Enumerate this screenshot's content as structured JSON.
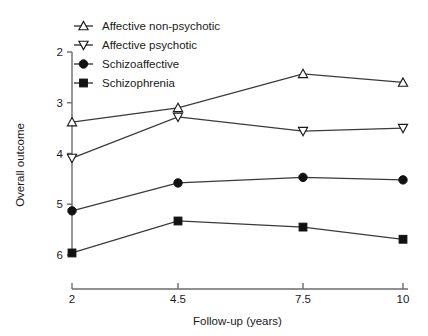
{
  "chart_data": {
    "type": "line",
    "title": "",
    "xlabel": "Follow-up (years)",
    "ylabel": "Overall outcome",
    "x": [
      2,
      4.5,
      7.5,
      10
    ],
    "x_tick_labels": [
      "2",
      "4.5",
      "7.5",
      "10"
    ],
    "y_tick_labels": [
      "2",
      "3",
      "4",
      "5",
      "6"
    ],
    "y_ticks": [
      2,
      3,
      4,
      5,
      6
    ],
    "ylim": [
      2,
      6
    ],
    "y_axis_inverted": true,
    "grid": false,
    "legend_position": "top-left",
    "series": [
      {
        "name": "Affective non-psychotic",
        "marker": "triangle-up-open",
        "values": [
          3.38,
          3.1,
          2.43,
          2.6
        ]
      },
      {
        "name": "Affective psychotic",
        "marker": "triangle-down-open",
        "values": [
          4.09,
          3.28,
          3.56,
          3.5
        ]
      },
      {
        "name": "Schizoaffective",
        "marker": "circle-filled",
        "values": [
          5.13,
          4.58,
          4.47,
          4.52
        ]
      },
      {
        "name": "Schizophrenia",
        "marker": "square-filled",
        "values": [
          5.96,
          5.33,
          5.45,
          5.69
        ]
      }
    ],
    "colors": {
      "line": "#3a3a3a",
      "marker_fill_open": "#ffffff",
      "marker_fill_solid": "#111111",
      "axis": "#6b6b6b",
      "text": "#1a1a1a",
      "background": "#ffffff"
    }
  }
}
